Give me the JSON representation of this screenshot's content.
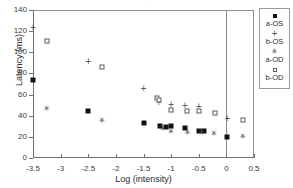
{
  "caption_strip": "· · ·",
  "chart_data": {
    "type": "scatter",
    "title": "",
    "xlabel": "Log (intensity)",
    "ylabel": "Latency (ms)",
    "xlim": [
      -3.5,
      0.5
    ],
    "ylim": [
      0,
      140
    ],
    "xticks": [
      -3.5,
      -3,
      -2.5,
      -2,
      -1.5,
      -1,
      -0.5,
      0,
      0.5
    ],
    "xtick_labels": [
      "-3.5",
      "-3",
      "-2.5",
      "-2",
      "-1.5",
      "-1",
      "-0.5",
      "0",
      "0.5"
    ],
    "yticks": [
      0,
      20,
      40,
      60,
      80,
      100,
      120,
      140
    ],
    "ytick_labels": [
      "0",
      "20",
      "40",
      "60",
      "80",
      "100",
      "120",
      "140"
    ],
    "grid": false,
    "legend_position": "right-outside",
    "annotations": [
      {
        "type": "vertical-line",
        "x": 0,
        "label": "zero-reference"
      }
    ],
    "series": [
      {
        "name": "a-OS",
        "marker": "filled-square",
        "points": [
          {
            "x": -3.5,
            "y": 74
          },
          {
            "x": -2.5,
            "y": 44
          },
          {
            "x": -1.5,
            "y": 33
          },
          {
            "x": -1.2,
            "y": 30
          },
          {
            "x": -1.1,
            "y": 29
          },
          {
            "x": -1.0,
            "y": 30
          },
          {
            "x": -0.75,
            "y": 28
          },
          {
            "x": -0.5,
            "y": 26
          },
          {
            "x": -0.4,
            "y": 26
          },
          {
            "x": 0.02,
            "y": 20
          }
        ]
      },
      {
        "name": "b-OS",
        "marker": "plus",
        "points": [
          {
            "x": -3.5,
            "y": 124
          },
          {
            "x": -2.5,
            "y": 92
          },
          {
            "x": -1.5,
            "y": 66
          },
          {
            "x": -1.22,
            "y": 53
          },
          {
            "x": -1.0,
            "y": 51
          },
          {
            "x": -0.75,
            "y": 50
          },
          {
            "x": -0.5,
            "y": 49
          },
          {
            "x": 0.02,
            "y": 38
          }
        ]
      },
      {
        "name": "a-OD",
        "marker": "asterisk",
        "points": [
          {
            "x": -3.25,
            "y": 47
          },
          {
            "x": -2.25,
            "y": 36
          },
          {
            "x": -1.15,
            "y": 28
          },
          {
            "x": -1.0,
            "y": 26
          },
          {
            "x": -0.7,
            "y": 25
          },
          {
            "x": -0.45,
            "y": 25
          },
          {
            "x": -0.22,
            "y": 24
          },
          {
            "x": 0.3,
            "y": 21
          }
        ]
      },
      {
        "name": "b-OD",
        "marker": "open-square",
        "points": [
          {
            "x": -3.25,
            "y": 111
          },
          {
            "x": -2.25,
            "y": 86
          },
          {
            "x": -1.25,
            "y": 57
          },
          {
            "x": -1.22,
            "y": 55
          },
          {
            "x": -1.0,
            "y": 45
          },
          {
            "x": -0.72,
            "y": 44
          },
          {
            "x": -0.5,
            "y": 44
          },
          {
            "x": -0.2,
            "y": 43
          },
          {
            "x": 0.3,
            "y": 36
          }
        ]
      }
    ]
  },
  "legend": {
    "entries": [
      {
        "label": "a-OS",
        "marker": "filled-square",
        "glyph": ""
      },
      {
        "label": "b-OS",
        "marker": "plus",
        "glyph": "+"
      },
      {
        "label": "a-OD",
        "marker": "asterisk",
        "glyph": "✳"
      },
      {
        "label": "b-OD",
        "marker": "open-square",
        "glyph": ""
      }
    ]
  }
}
